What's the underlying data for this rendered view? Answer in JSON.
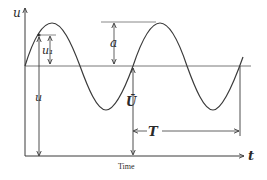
{
  "diagram": {
    "type": "periodic-signal-annotation",
    "axes": {
      "y_label": "u",
      "x_label": "t",
      "x_caption": "Time"
    },
    "annotations": {
      "instantaneous_value": "u₁",
      "total_value": "u",
      "amplitude": "a",
      "mean_value": "Ū",
      "period": "T"
    },
    "colors": {
      "line": "#3a3a3a",
      "background": "#ffffff"
    }
  }
}
